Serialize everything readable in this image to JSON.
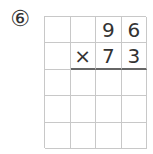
{
  "problem": {
    "number_label": "⑥",
    "rows": [
      [
        "",
        "",
        "9",
        "6"
      ],
      [
        "",
        "×",
        "7",
        "3"
      ],
      [
        "",
        "",
        "",
        ""
      ],
      [
        "",
        "",
        "",
        ""
      ],
      [
        "",
        "",
        "",
        ""
      ]
    ]
  }
}
